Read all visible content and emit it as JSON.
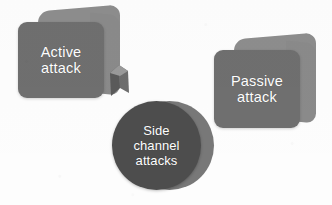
{
  "diagram": {
    "title": "Side channel attacks",
    "background_color": "#fdfdfd",
    "nodes": [
      {
        "id": "active-attack",
        "shape": "box-3d",
        "label": "Active\nattack",
        "label_line_1": "Active",
        "label_line_2": "attack",
        "fill_color": "#6f6f6f",
        "back_color": "#8d8d8d",
        "text_color": "#ffffff"
      },
      {
        "id": "passive-attack",
        "shape": "box-3d",
        "label": "Passive\nattack",
        "label_line_1": "Passive",
        "label_line_2": "attack",
        "fill_color": "#6f6f6f",
        "back_color": "#8d8d8d",
        "text_color": "#ffffff"
      },
      {
        "id": "side-channel-attacks",
        "shape": "circle-3d",
        "label": "Side\nchannel\nattacks",
        "label_line_1": "Side",
        "label_line_2": "channel",
        "label_line_3": "attacks",
        "fill_color": "#4d4d4d",
        "back_color": "#787878",
        "text_color": "#ffffff"
      }
    ],
    "connector": {
      "id": "active-to-circle",
      "kind": "arrow-wedge",
      "color": "#555555"
    }
  }
}
